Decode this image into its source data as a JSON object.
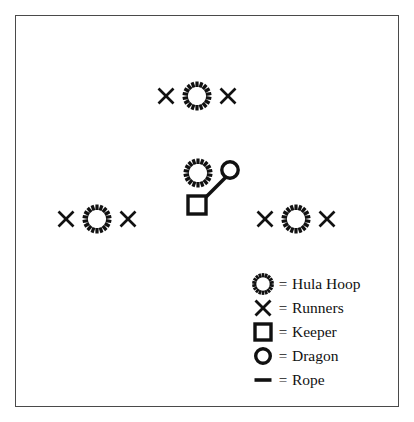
{
  "diagram": {
    "stroke_color": "#111111",
    "border_color": "#4a4a4a",
    "background_color": "#ffffff",
    "groups": [
      {
        "name": "top-group",
        "items": [
          {
            "type": "runner",
            "x": 166,
            "y": 96
          },
          {
            "type": "hula-hoop",
            "x": 197,
            "y": 96
          },
          {
            "type": "runner",
            "x": 228,
            "y": 96
          }
        ]
      },
      {
        "name": "left-group",
        "items": [
          {
            "type": "runner",
            "x": 66,
            "y": 219
          },
          {
            "type": "hula-hoop",
            "x": 97,
            "y": 219
          },
          {
            "type": "runner",
            "x": 128,
            "y": 219
          }
        ]
      },
      {
        "name": "right-group",
        "items": [
          {
            "type": "runner",
            "x": 265,
            "y": 219
          },
          {
            "type": "hula-hoop",
            "x": 296,
            "y": 219
          },
          {
            "type": "runner",
            "x": 327,
            "y": 219
          }
        ]
      },
      {
        "name": "center-group",
        "items": [
          {
            "type": "hula-hoop",
            "x": 198,
            "y": 173
          },
          {
            "type": "dragon",
            "x": 230,
            "y": 170
          },
          {
            "type": "keeper",
            "x": 197,
            "y": 205
          },
          {
            "type": "rope",
            "x1": 203,
            "y1": 200,
            "x2": 226,
            "y2": 177
          }
        ]
      }
    ]
  },
  "legend": {
    "equals_sign": "=",
    "rows": [
      {
        "icon": "hula-hoop-icon",
        "label": "Hula Hoop"
      },
      {
        "icon": "runner-x-icon",
        "label": "Runners"
      },
      {
        "icon": "keeper-square-icon",
        "label": "Keeper"
      },
      {
        "icon": "dragon-circle-icon",
        "label": "Dragon"
      },
      {
        "icon": "rope-line-icon",
        "label": "Rope"
      }
    ]
  }
}
